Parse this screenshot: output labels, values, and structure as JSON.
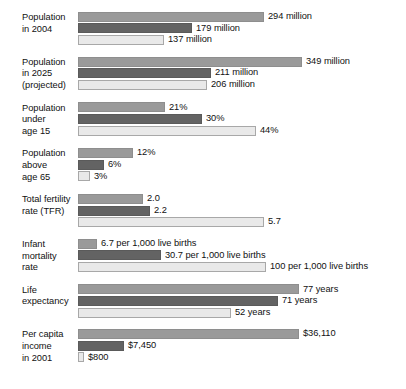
{
  "chart_data": {
    "type": "bar",
    "orientation": "horizontal",
    "title": "",
    "xlabel": "",
    "ylabel": "",
    "grid": false,
    "legend": "none",
    "series": [
      {
        "name": "series-1",
        "color": "#9a9a9a"
      },
      {
        "name": "series-2",
        "color": "#636363"
      },
      {
        "name": "series-3",
        "color": "#e9e9e9"
      }
    ],
    "categories": [
      "Population in 2004",
      "Population in 2025 (projected)",
      "Population under age 15",
      "Population above age 65",
      "Total fertility rate (TFR)",
      "Infant mortality rate",
      "Life expectancy",
      "Per capita income in 2001"
    ],
    "groups": [
      {
        "label_lines": [
          "Population",
          "in 2004"
        ],
        "bars": [
          {
            "value": 294,
            "label": "294 million",
            "width_px": 186
          },
          {
            "value": 179,
            "label": "179 million",
            "width_px": 114
          },
          {
            "value": 137,
            "label": "137 million",
            "width_px": 86
          }
        ]
      },
      {
        "label_lines": [
          "Population",
          "in 2025",
          "(projected)"
        ],
        "bars": [
          {
            "value": 349,
            "label": "349 million",
            "width_px": 224
          },
          {
            "value": 211,
            "label": "211 million",
            "width_px": 133
          },
          {
            "value": 206,
            "label": "206 million",
            "width_px": 129
          }
        ]
      },
      {
        "label_lines": [
          "Population",
          "under",
          "age 15"
        ],
        "bars": [
          {
            "value": 21,
            "label": "21%",
            "width_px": 87
          },
          {
            "value": 30,
            "label": "30%",
            "width_px": 124
          },
          {
            "value": 44,
            "label": "44%",
            "width_px": 178
          }
        ]
      },
      {
        "label_lines": [
          "Population",
          "above",
          "age 65"
        ],
        "bars": [
          {
            "value": 12,
            "label": "12%",
            "width_px": 55
          },
          {
            "value": 6,
            "label": "6%",
            "width_px": 26
          },
          {
            "value": 3,
            "label": "3%",
            "width_px": 12
          }
        ]
      },
      {
        "label_lines": [
          "Total fertility",
          "rate (TFR)"
        ],
        "bars": [
          {
            "value": 2.0,
            "label": "2.0",
            "width_px": 65
          },
          {
            "value": 2.2,
            "label": "2.2",
            "width_px": 72
          },
          {
            "value": 5.7,
            "label": "5.7",
            "width_px": 186
          }
        ]
      },
      {
        "label_lines": [
          "Infant",
          "mortality",
          "rate"
        ],
        "bars": [
          {
            "value": 6.7,
            "label": "6.7 per 1,000 live births",
            "width_px": 19
          },
          {
            "value": 30.7,
            "label": "30.7 per 1,000 live births",
            "width_px": 83
          },
          {
            "value": 100,
            "label": "100 per 1,000 live births",
            "width_px": 188
          }
        ]
      },
      {
        "label_lines": [
          "Life",
          "expectancy"
        ],
        "bars": [
          {
            "value": 77,
            "label": "77 years",
            "width_px": 221
          },
          {
            "value": 71,
            "label": "71 years",
            "width_px": 200
          },
          {
            "value": 52,
            "label": "52 years",
            "width_px": 153
          }
        ]
      },
      {
        "label_lines": [
          "Per capita",
          "income",
          "in 2001"
        ],
        "bars": [
          {
            "value": 36110,
            "label": "$36,110",
            "width_px": 221
          },
          {
            "value": 7450,
            "label": "$7,450",
            "width_px": 46
          },
          {
            "value": 800,
            "label": "$800",
            "width_px": 6
          }
        ]
      }
    ]
  }
}
